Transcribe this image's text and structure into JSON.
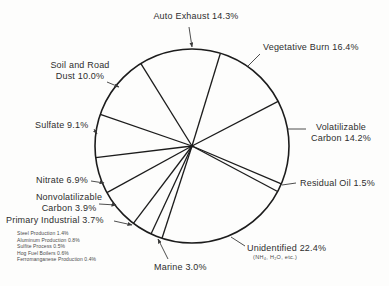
{
  "colors": {
    "ink": "#222222",
    "leader": "#3a3a3a",
    "background": "#fdfdfc"
  },
  "chart_data": {
    "type": "pie",
    "title": "",
    "unit": "%",
    "legend_position": "outside-callouts",
    "geometry": {
      "cx": 192,
      "cy": 146,
      "r": 97
    },
    "slices": [
      {
        "label": "Auto Exhaust",
        "value": 14.3,
        "start_deg": 328.2
      },
      {
        "label": "Vegetative Burn",
        "value": 16.4,
        "start_deg": 17.0
      },
      {
        "label": "Volatilizable Carbon",
        "value": 14.2,
        "start_deg": 62.6
      },
      {
        "label": "Residual Oil",
        "value": 1.5,
        "start_deg": 113.0
      },
      {
        "label": "Unidentified",
        "value": 22.4,
        "start_deg": 118.0,
        "note": "(NH₄, H₂O, etc.)"
      },
      {
        "label": "Marine",
        "value": 3.0,
        "start_deg": 198.0
      },
      {
        "label": "Primary Industrial",
        "value": 3.7,
        "start_deg": 205.0
      },
      {
        "label": "Nonvolatilizable Carbon",
        "value": 3.9,
        "start_deg": 217.2
      },
      {
        "label": "Nitrate",
        "value": 6.9,
        "start_deg": 241.3
      },
      {
        "label": "Sulfate",
        "value": 9.1,
        "start_deg": 263.1
      },
      {
        "label": "Soil and Road Dust",
        "value": 10.0,
        "start_deg": 289.1
      }
    ],
    "primary_industrial_breakdown": [
      {
        "label": "Steel Production",
        "value": 1.4
      },
      {
        "label": "Aluminum Production",
        "value": 0.8
      },
      {
        "label": "Sulfite Process",
        "value": 0.5
      },
      {
        "label": "Hog Fuel Boilers",
        "value": 0.6
      },
      {
        "label": "Ferromanganese Production",
        "value": 0.4
      }
    ]
  },
  "callouts": [
    {
      "id": "auto-exhaust",
      "lines": [
        "Auto Exhaust 14.3%"
      ]
    },
    {
      "id": "vegetative-burn",
      "lines": [
        "Vegetative Burn 16.4%"
      ]
    },
    {
      "id": "soil-road-dust",
      "lines": [
        "Soil and Road",
        "Dust 10.0%"
      ]
    },
    {
      "id": "sulfate",
      "lines": [
        "Sulfate 9.1%"
      ]
    },
    {
      "id": "volatilizable-carbon",
      "lines": [
        "Volatilizable",
        "Carbon 14.2%"
      ]
    },
    {
      "id": "residual-oil",
      "lines": [
        "Residual Oil 1.5%"
      ]
    },
    {
      "id": "nitrate",
      "lines": [
        "Nitrate 6.9%"
      ]
    },
    {
      "id": "nonvolatilizable-carbon",
      "lines": [
        "Nonvolatilizable",
        "Carbon 3.9%"
      ]
    },
    {
      "id": "primary-industrial",
      "lines": [
        "Primary Industrial 3.7%"
      ]
    },
    {
      "id": "marine",
      "lines": [
        "Marine 3.0%"
      ]
    },
    {
      "id": "unidentified",
      "lines": [
        "Unidentified 22.4%",
        "(NH₄, H₂O, etc.)"
      ]
    }
  ]
}
